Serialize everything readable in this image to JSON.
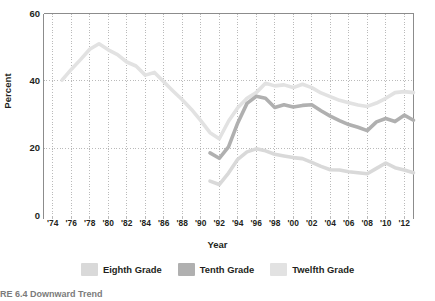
{
  "figure": {
    "caption": "RE 6.4  Downward Trend",
    "background": "#ffffff",
    "ink": "#231f20"
  },
  "axes": {
    "ylabel": "Percent",
    "xlabel": "Year",
    "yticks": [
      "0",
      "20",
      "40",
      "60"
    ],
    "xticks": [
      "'74",
      "'76",
      "'78",
      "'80",
      "'82",
      "'84",
      "'86",
      "'88",
      "'90",
      "'92",
      "'94",
      "'96",
      "'98",
      "'00",
      "'02",
      "'04",
      "'06",
      "'08",
      "'10",
      "'12"
    ]
  },
  "legend": {
    "items": [
      {
        "label": "Eighth Grade",
        "color": "#d9d9d9"
      },
      {
        "label": "Tenth Grade",
        "color": "#b0b0b0"
      },
      {
        "label": "Twelfth Grade",
        "color": "#e2e2e2"
      }
    ]
  },
  "chart_data": {
    "type": "line",
    "title": "",
    "xlabel": "Year",
    "ylabel": "Percent",
    "xlim": [
      1973,
      2013
    ],
    "ylim": [
      0,
      60
    ],
    "yticks": [
      0,
      20,
      40,
      60
    ],
    "grid": "dotted-both",
    "legend_position": "bottom",
    "series": [
      {
        "name": "Twelfth Grade",
        "color": "#e2e2e2",
        "x": [
          1975,
          1976,
          1977,
          1978,
          1979,
          1980,
          1981,
          1982,
          1983,
          1984,
          1985,
          1986,
          1987,
          1988,
          1989,
          1990,
          1991,
          1992,
          1993,
          1994,
          1995,
          1996,
          1997,
          1998,
          1999,
          2000,
          2001,
          2002,
          2003,
          2004,
          2005,
          2006,
          2007,
          2008,
          2009,
          2010,
          2011,
          2012,
          2013
        ],
        "y": [
          40.2,
          43.4,
          46.3,
          49.4,
          51.0,
          49.2,
          47.8,
          45.6,
          44.4,
          41.7,
          42.5,
          39.7,
          37.0,
          34.4,
          31.5,
          28.2,
          24.6,
          22.8,
          28.0,
          32.0,
          34.8,
          36.5,
          39.3,
          38.5,
          38.8,
          38.0,
          39.0,
          38.0,
          36.4,
          35.3,
          34.2,
          33.5,
          32.8,
          32.4,
          33.4,
          34.8,
          36.5,
          36.8,
          36.5
        ]
      },
      {
        "name": "Tenth Grade",
        "color": "#b0b0b0",
        "x": [
          1991,
          1992,
          1993,
          1994,
          1995,
          1996,
          1997,
          1998,
          1999,
          2000,
          2001,
          2002,
          2003,
          2004,
          2005,
          2006,
          2007,
          2008,
          2009,
          2010,
          2011,
          2012,
          2013
        ],
        "y": [
          18.6,
          17.0,
          20.4,
          27.5,
          33.3,
          35.4,
          34.8,
          32.1,
          32.9,
          32.2,
          32.7,
          32.9,
          31.1,
          29.5,
          28.2,
          27.0,
          26.2,
          25.2,
          27.8,
          28.8,
          27.9,
          29.8,
          28.3
        ]
      },
      {
        "name": "Eighth Grade",
        "color": "#d9d9d9",
        "x": [
          1991,
          1992,
          1993,
          1994,
          1995,
          1996,
          1997,
          1998,
          1999,
          2000,
          2001,
          2002,
          2003,
          2004,
          2005,
          2006,
          2007,
          2008,
          2009,
          2010,
          2011,
          2012,
          2013
        ],
        "y": [
          10.2,
          9.2,
          12.6,
          16.7,
          18.9,
          19.8,
          19.2,
          18.2,
          17.7,
          17.2,
          16.9,
          15.8,
          14.6,
          13.6,
          13.5,
          13.0,
          12.7,
          12.4,
          14.0,
          15.6,
          14.2,
          13.5,
          12.7
        ]
      }
    ]
  }
}
